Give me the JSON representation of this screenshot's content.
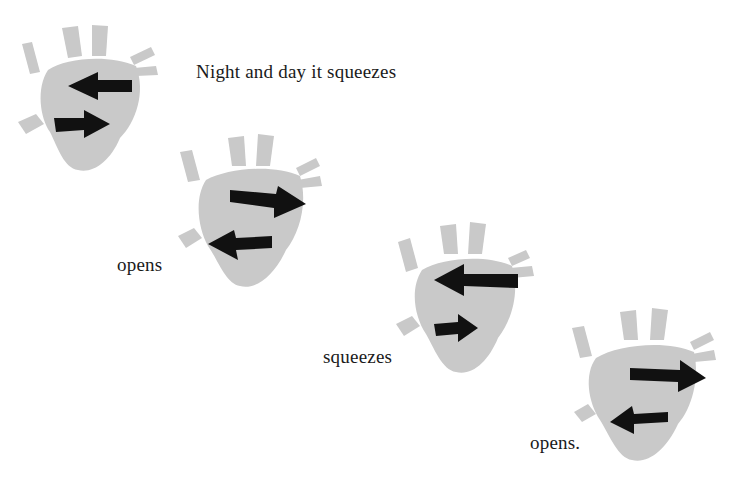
{
  "page": {
    "background": "#ffffff",
    "heart_color": "#c9c9c9",
    "arrow_color": "#111111"
  },
  "captions": [
    {
      "text": "Night and day it squeezes"
    },
    {
      "text": "opens"
    },
    {
      "text": "squeezes"
    },
    {
      "text": "opens."
    }
  ],
  "illustrations": [
    {
      "label": "heart-1",
      "top_arrow": "left",
      "bottom_arrow": "right",
      "state": "squeezes"
    },
    {
      "label": "heart-2",
      "top_arrow": "right",
      "bottom_arrow": "left",
      "state": "opens"
    },
    {
      "label": "heart-3",
      "top_arrow": "left",
      "bottom_arrow": "right",
      "state": "squeezes"
    },
    {
      "label": "heart-4",
      "top_arrow": "right",
      "bottom_arrow": "left",
      "state": "opens"
    }
  ]
}
